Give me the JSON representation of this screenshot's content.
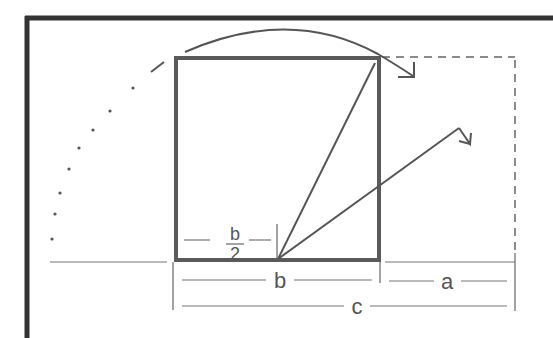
{
  "diagram": {
    "colors": {
      "frame": "#333333",
      "square": "#555555",
      "line": "#555555",
      "dimension": "#777777",
      "dashed": "#666666",
      "label": "#555555",
      "background": "#ffffff"
    },
    "labels": {
      "half_b_numerator": "b",
      "half_b_denominator": "2",
      "b": "b",
      "a": "a",
      "c": "c"
    },
    "elements": {
      "outer_frame": "frame-top-left",
      "square": "square-side-b",
      "rotated_rectangle": "dashed-rectangle",
      "arc_arrow": "top-curved-arrow",
      "dotted_arc": "left-dotted-arc",
      "diagonal_to_corner": "line-midpoint-to-top-right",
      "diagonal_arrow": "arrow-midpoint-extended"
    }
  }
}
